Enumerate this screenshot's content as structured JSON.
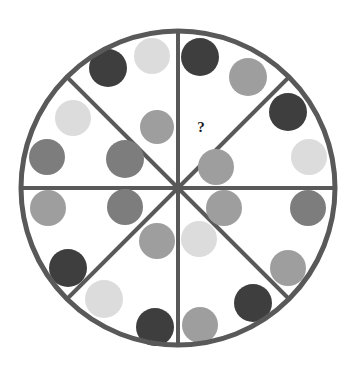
{
  "canvas": {
    "width": 355,
    "height": 377,
    "background": "#ffffff"
  },
  "figure": {
    "name": "segmented-circle-dot-puzzle",
    "type": "matrix-reasoning-puzzle",
    "circle": {
      "center_x": 178,
      "center_y": 188,
      "radius": 157,
      "stroke_color": "#595959",
      "stroke_width": 5,
      "fill_color": "#ffffff"
    },
    "dividers": {
      "stroke_color": "#595959",
      "stroke_width": 4,
      "count": 4,
      "angles_deg": [
        0,
        45,
        90,
        135
      ],
      "labels": [
        "horizontal",
        "diagonal-nw-se",
        "vertical",
        "diagonal-ne-sw"
      ]
    },
    "question_mark": {
      "glyph": "?",
      "x": 201,
      "y": 129,
      "font_size": 15,
      "color": "#1a1a1a"
    }
  },
  "palette": {
    "dark_charcoal": "#3e3e3e",
    "mid_dark_gray": "#7d7d7d",
    "medium_gray": "#9e9e9e",
    "light_gray": "#c2c2c2",
    "very_light_gray": "#dcdcdc",
    "outline": "#595959",
    "background": "#ffffff",
    "ink": "#1a1a1a"
  },
  "legend": {
    "title": "Dot shades used",
    "entries": [
      {
        "name": "dark-charcoal",
        "color": "#3e3e3e"
      },
      {
        "name": "mid-dark-gray",
        "color": "#7d7d7d"
      },
      {
        "name": "medium-gray",
        "color": "#9e9e9e"
      },
      {
        "name": "light-gray",
        "color": "#c2c2c2"
      },
      {
        "name": "very-light-gray",
        "color": "#dcdcdc"
      }
    ]
  },
  "sectors": [
    {
      "id": "sector-nne",
      "label": "North-northeast sector",
      "position_clock": "12 to 1:30",
      "has_question_mark": true,
      "dot_count": 3
    },
    {
      "id": "sector-ene",
      "label": "East-northeast sector",
      "position_clock": "1:30 to 3",
      "has_question_mark": false,
      "dot_count": 3
    },
    {
      "id": "sector-ese",
      "label": "East-southeast sector",
      "position_clock": "3 to 4:30",
      "has_question_mark": false,
      "dot_count": 3
    },
    {
      "id": "sector-sse",
      "label": "South-southeast sector",
      "position_clock": "4:30 to 6",
      "has_question_mark": false,
      "dot_count": 3
    },
    {
      "id": "sector-ssw",
      "label": "South-southwest sector",
      "position_clock": "6 to 7:30",
      "has_question_mark": false,
      "dot_count": 3
    },
    {
      "id": "sector-wsw",
      "label": "West-southwest sector",
      "position_clock": "7:30 to 9",
      "has_question_mark": false,
      "dot_count": 3
    },
    {
      "id": "sector-wnw",
      "label": "West-northwest sector",
      "position_clock": "9 to 10:30",
      "has_question_mark": false,
      "dot_count": 3
    },
    {
      "id": "sector-nnw",
      "label": "North-northwest sector",
      "position_clock": "10:30 to 12",
      "has_question_mark": false,
      "dot_count": 3
    }
  ],
  "dots": [
    {
      "id": "dot-01",
      "sector": "sector-nnw",
      "cx": 108,
      "cy": 68,
      "r": 19,
      "color": "#3e3e3e",
      "shade": "dark-charcoal"
    },
    {
      "id": "dot-02",
      "sector": "sector-nnw",
      "cx": 152,
      "cy": 56,
      "r": 18,
      "color": "#dcdcdc",
      "shade": "very-light-gray"
    },
    {
      "id": "dot-03",
      "sector": "sector-nnw",
      "cx": 157,
      "cy": 127,
      "r": 17,
      "color": "#9e9e9e",
      "shade": "medium-gray"
    },
    {
      "id": "dot-04",
      "sector": "sector-nne",
      "cx": 200,
      "cy": 57,
      "r": 19,
      "color": "#3e3e3e",
      "shade": "dark-charcoal"
    },
    {
      "id": "dot-05",
      "sector": "sector-nne",
      "cx": 216,
      "cy": 167,
      "r": 18,
      "color": "#9e9e9e",
      "shade": "medium-gray"
    },
    {
      "id": "dot-06",
      "sector": "sector-ene",
      "cx": 248,
      "cy": 77,
      "r": 19,
      "color": "#9e9e9e",
      "shade": "medium-gray"
    },
    {
      "id": "dot-07",
      "sector": "sector-ene",
      "cx": 288,
      "cy": 112,
      "r": 19,
      "color": "#3e3e3e",
      "shade": "dark-charcoal"
    },
    {
      "id": "dot-08",
      "sector": "sector-ene",
      "cx": 309,
      "cy": 157,
      "r": 18,
      "color": "#dcdcdc",
      "shade": "very-light-gray"
    },
    {
      "id": "dot-09",
      "sector": "sector-ese",
      "cx": 308,
      "cy": 208,
      "r": 18,
      "color": "#7d7d7d",
      "shade": "mid-dark-gray"
    },
    {
      "id": "dot-10",
      "sector": "sector-ese",
      "cx": 224,
      "cy": 208,
      "r": 18,
      "color": "#9e9e9e",
      "shade": "medium-gray"
    },
    {
      "id": "dot-11",
      "sector": "sector-ese",
      "cx": 288,
      "cy": 268,
      "r": 18,
      "color": "#9e9e9e",
      "shade": "medium-gray"
    },
    {
      "id": "dot-12",
      "sector": "sector-sse",
      "cx": 253,
      "cy": 303,
      "r": 19,
      "color": "#3e3e3e",
      "shade": "dark-charcoal"
    },
    {
      "id": "dot-13",
      "sector": "sector-sse",
      "cx": 200,
      "cy": 325,
      "r": 18,
      "color": "#9e9e9e",
      "shade": "medium-gray"
    },
    {
      "id": "dot-14",
      "sector": "sector-sse",
      "cx": 199,
      "cy": 239,
      "r": 18,
      "color": "#dcdcdc",
      "shade": "very-light-gray"
    },
    {
      "id": "dot-15",
      "sector": "sector-ssw",
      "cx": 155,
      "cy": 327,
      "r": 19,
      "color": "#3e3e3e",
      "shade": "dark-charcoal"
    },
    {
      "id": "dot-16",
      "sector": "sector-ssw",
      "cx": 104,
      "cy": 299,
      "r": 19,
      "color": "#dcdcdc",
      "shade": "very-light-gray"
    },
    {
      "id": "dot-17",
      "sector": "sector-ssw",
      "cx": 157,
      "cy": 241,
      "r": 18,
      "color": "#9e9e9e",
      "shade": "medium-gray"
    },
    {
      "id": "dot-18",
      "sector": "sector-wsw",
      "cx": 68,
      "cy": 268,
      "r": 19,
      "color": "#3e3e3e",
      "shade": "dark-charcoal"
    },
    {
      "id": "dot-19",
      "sector": "sector-wsw",
      "cx": 125,
      "cy": 207,
      "r": 18,
      "color": "#7d7d7d",
      "shade": "mid-dark-gray"
    },
    {
      "id": "dot-20",
      "sector": "sector-wsw",
      "cx": 48,
      "cy": 208,
      "r": 18,
      "color": "#9e9e9e",
      "shade": "medium-gray"
    },
    {
      "id": "dot-21",
      "sector": "sector-wnw",
      "cx": 47,
      "cy": 157,
      "r": 18,
      "color": "#7d7d7d",
      "shade": "mid-dark-gray"
    },
    {
      "id": "dot-22",
      "sector": "sector-wnw",
      "cx": 125,
      "cy": 159,
      "r": 19,
      "color": "#7d7d7d",
      "shade": "mid-dark-gray"
    },
    {
      "id": "dot-23",
      "sector": "sector-wnw",
      "cx": 73,
      "cy": 118,
      "r": 18,
      "color": "#dcdcdc",
      "shade": "very-light-gray"
    }
  ]
}
